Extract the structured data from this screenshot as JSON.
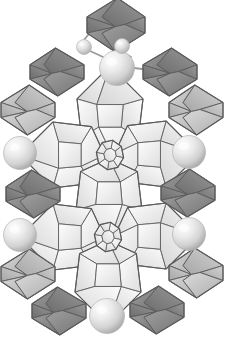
{
  "figure": {
    "background_color": "#ffffff",
    "canvas": {
      "width": 242,
      "height": 356
    }
  },
  "palette": {
    "dark_polyhedron_fill": "#8a8a8a",
    "dark_polyhedron_fill_light": "#9d9d9d",
    "dark_polyhedron_fill_shadow": "#6f6f6f",
    "medium_polyhedron_fill": "#c2c2c2",
    "medium_polyhedron_fill_light": "#d6d6d6",
    "medium_polyhedron_fill_shadow": "#a8a8a8",
    "light_polyhedron_fill": "#f2f2f2",
    "light_polyhedron_fill_shadow": "#d9d9d9",
    "light_polyhedron_fill_bright": "#fcfcfc",
    "edge_stroke": "#5a5a5a",
    "edge_stroke_light": "#888888",
    "sphere_highlight": "#fbfbfb",
    "sphere_mid": "#dcdcdc",
    "sphere_shadow": "#a5a5a5",
    "bond_stroke": "#9a9a9a"
  },
  "legend": {
    "dark_label": "dark bipyramid",
    "medium_label": "medium bipyramid",
    "light_label": "light bipyramid",
    "sphere_label": "sphere node",
    "hub_label": "central polyhedron",
    "bond_label": "bond"
  },
  "nodes": {
    "spheres": [
      {
        "id": "sphere-top-large",
        "cx": 117,
        "cy": 68,
        "r": 17.5,
        "size": "large"
      },
      {
        "id": "sphere-top-left-small",
        "cx": 84,
        "cy": 47,
        "r": 7.5,
        "size": "small"
      },
      {
        "id": "sphere-top-right-small",
        "cx": 122,
        "cy": 46,
        "r": 7.5,
        "size": "small"
      },
      {
        "id": "sphere-mid-left",
        "cx": 20,
        "cy": 153,
        "r": 16.5,
        "size": "large"
      },
      {
        "id": "sphere-mid-right",
        "cx": 189,
        "cy": 152,
        "r": 16.5,
        "size": "large"
      },
      {
        "id": "sphere-low-left",
        "cx": 20,
        "cy": 235,
        "r": 16.5,
        "size": "large"
      },
      {
        "id": "sphere-low-right",
        "cx": 189,
        "cy": 234,
        "r": 16.5,
        "size": "large"
      },
      {
        "id": "sphere-bottom",
        "cx": 107,
        "cy": 316,
        "r": 17.5,
        "size": "large"
      }
    ],
    "hubs": [
      {
        "id": "hub-upper",
        "cx": 110,
        "cy": 155,
        "r": 15
      },
      {
        "id": "hub-lower",
        "cx": 108,
        "cy": 237,
        "r": 15
      }
    ],
    "bonds": [
      {
        "id": "bond-top-left",
        "x1": 103,
        "y1": 57,
        "x2": 88,
        "y2": 50
      },
      {
        "id": "bond-top-right",
        "x1": 131,
        "y1": 57,
        "x2": 119,
        "y2": 50
      },
      {
        "id": "bond-cap-left",
        "x1": 84,
        "y1": 40,
        "x2": 92,
        "y2": 30
      },
      {
        "id": "bond-cap-right",
        "x1": 123,
        "y1": 39,
        "x2": 133,
        "y2": 31
      },
      {
        "id": "bond-sphere-poly-left",
        "x1": 36,
        "y1": 153,
        "x2": 56,
        "y2": 154
      },
      {
        "id": "bond-sphere-poly-right",
        "x1": 173,
        "y1": 152,
        "x2": 156,
        "y2": 153
      },
      {
        "id": "bond-sphere-poly-left2",
        "x1": 36,
        "y1": 235,
        "x2": 56,
        "y2": 236
      },
      {
        "id": "bond-sphere-poly-right2",
        "x1": 173,
        "y1": 234,
        "x2": 156,
        "y2": 235
      },
      {
        "id": "bond-top-sphere-right",
        "x1": 134,
        "y1": 68,
        "x2": 150,
        "y2": 70
      }
    ]
  },
  "polyhedra": {
    "dark": [
      {
        "id": "dark-top-center",
        "cx": 116,
        "cy": 25,
        "rx": 29,
        "ry": 27,
        "label": "top centre dark bipyramid"
      },
      {
        "id": "dark-upper-left",
        "cx": 57,
        "cy": 72,
        "rx": 27,
        "ry": 24,
        "label": "upper left dark bipyramid"
      },
      {
        "id": "dark-upper-right",
        "cx": 170,
        "cy": 72,
        "rx": 27,
        "ry": 24,
        "label": "upper right dark bipyramid"
      },
      {
        "id": "dark-mid-left",
        "cx": 33,
        "cy": 194,
        "rx": 27,
        "ry": 24,
        "label": "mid left dark bipyramid"
      },
      {
        "id": "dark-mid-right",
        "cx": 188,
        "cy": 193,
        "rx": 27,
        "ry": 24,
        "label": "mid right dark bipyramid"
      },
      {
        "id": "dark-bot-left",
        "cx": 59,
        "cy": 311,
        "rx": 27,
        "ry": 24,
        "label": "bottom left dark bipyramid"
      },
      {
        "id": "dark-bot-right",
        "cx": 157,
        "cy": 310,
        "rx": 27,
        "ry": 24,
        "label": "bottom right dark bipyramid"
      }
    ],
    "medium": [
      {
        "id": "medium-left-upper",
        "cx": 28,
        "cy": 110,
        "rx": 27,
        "ry": 25,
        "label": "upper left medium bipyramid"
      },
      {
        "id": "medium-right-upper",
        "cx": 196,
        "cy": 110,
        "rx": 27,
        "ry": 25,
        "label": "upper right medium bipyramid"
      },
      {
        "id": "medium-left-lower",
        "cx": 28,
        "cy": 274,
        "rx": 27,
        "ry": 25,
        "label": "lower left medium bipyramid"
      },
      {
        "id": "medium-right-lower",
        "cx": 196,
        "cy": 273,
        "rx": 27,
        "ry": 25,
        "label": "lower right medium bipyramid"
      }
    ],
    "light": [
      {
        "id": "light-upper-center",
        "cx": 110,
        "cy": 113,
        "label": "upper central light polyhedron",
        "orient": "up"
      },
      {
        "id": "light-left-upper",
        "cx": 67,
        "cy": 155,
        "label": "upper left light polyhedron",
        "orient": "left"
      },
      {
        "id": "light-right-upper",
        "cx": 152,
        "cy": 154,
        "label": "upper right light polyhedron",
        "orient": "right"
      },
      {
        "id": "light-mid-center",
        "cx": 109,
        "cy": 196,
        "label": "middle light polyhedron",
        "orient": "down"
      },
      {
        "id": "light-left-lower",
        "cx": 67,
        "cy": 237,
        "label": "lower left light polyhedron",
        "orient": "left"
      },
      {
        "id": "light-right-lower",
        "cx": 152,
        "cy": 236,
        "label": "lower right light polyhedron",
        "orient": "right"
      },
      {
        "id": "light-bottom-center",
        "cx": 108,
        "cy": 278,
        "label": "bottom central light polyhedron",
        "orient": "down"
      }
    ]
  }
}
